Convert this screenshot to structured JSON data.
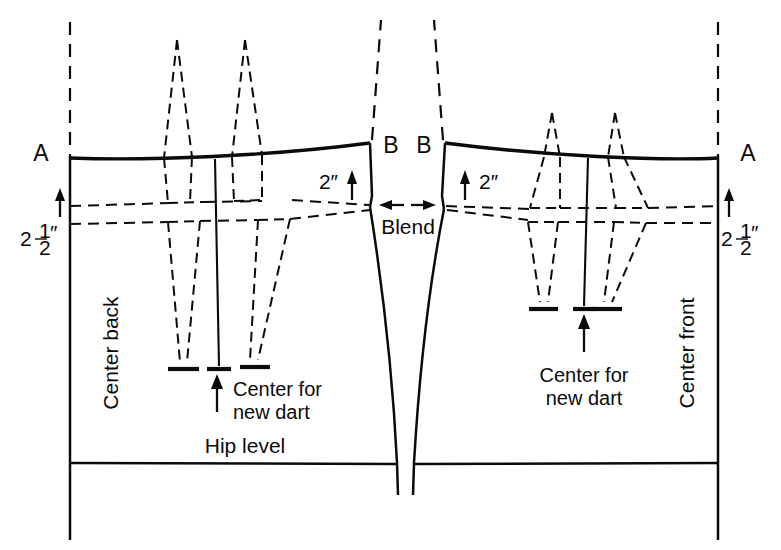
{
  "diagram": {
    "type": "pattern-drafting-line-drawing"
  },
  "labels": {
    "point_a_left": "A",
    "point_a_right": "A",
    "point_b_left": "B",
    "point_b_right": "B",
    "measure_two_half_left": "2",
    "measure_two_half_right": "2",
    "fraction_numerator": "1",
    "fraction_denominator": "2",
    "inch_mark": "″",
    "measure_two_left": "2″",
    "measure_two_right": "2″",
    "blend": "Blend",
    "center_back": "Center back",
    "center_front": "Center front",
    "center_new_dart_left_line1": "Center for",
    "center_new_dart_left_line2": "new dart",
    "center_new_dart_right_line1": "Center for",
    "center_new_dart_right_line2": "new dart",
    "hip_level": "Hip level"
  },
  "measurements": {
    "waist_drop": "2½″",
    "side_rise": "2″"
  },
  "colors": {
    "ink": "#0b0b0b",
    "paper": "#ffffff"
  },
  "geometry": {
    "center_back_x": 70,
    "center_front_x": 718,
    "waist_y_outer": 158,
    "waist_y_inner": 145,
    "guide_upper_y": 203,
    "guide_lower_y": 221,
    "hip_level_y": 463,
    "bottom_y": 540,
    "blend_left_x": 370,
    "blend_right_x": 445,
    "dart_center_left_x": 215,
    "dart_center_right_x": 588,
    "dart_tip_left_y": 365,
    "dart_tip_right_y": 305
  },
  "elements": {
    "waistline": "solid curved upper edge from A to B on both halves",
    "side_seam": "two solid curves meeting at the blend points and descending to hip level",
    "old_darts": "dashed dart outlines shown above and below the waistline",
    "new_darts": "solid vertical center lines with T-bar ends marking new dart centers",
    "guide_lines": "two dashed horizontal construction lines below the waist",
    "hip_line": "solid horizontal line at hip level"
  }
}
